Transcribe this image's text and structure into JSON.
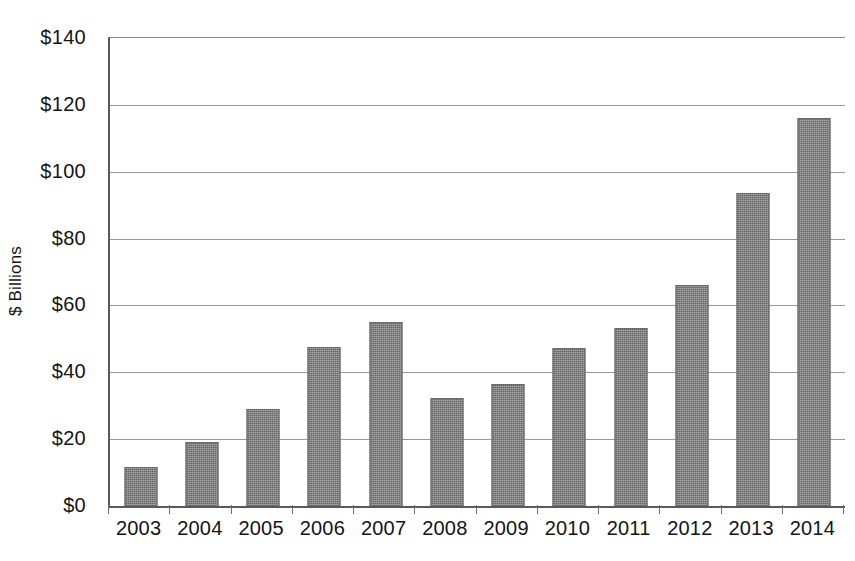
{
  "chart_data": {
    "type": "bar",
    "title": "",
    "xlabel": "",
    "ylabel": "$ Billions",
    "categories": [
      "2003",
      "2004",
      "2005",
      "2006",
      "2007",
      "2008",
      "2009",
      "2010",
      "2011",
      "2012",
      "2013",
      "2014"
    ],
    "values": [
      11.6,
      19.2,
      29.1,
      47.5,
      55.0,
      32.3,
      36.4,
      47.4,
      53.2,
      66.0,
      93.5,
      116.0
    ],
    "ytick_labels": [
      "$140",
      "$120",
      "$100",
      "$80",
      "$60",
      "$40",
      "$20",
      "$0"
    ],
    "ytick_values": [
      140,
      120,
      100,
      80,
      60,
      40,
      20,
      0
    ],
    "ylim": [
      0,
      140
    ],
    "grid": true,
    "legend": false,
    "bar_color": "#7d7d7d",
    "axis_color": "#5a5a5a",
    "grid_color": "#9a9a9a"
  }
}
